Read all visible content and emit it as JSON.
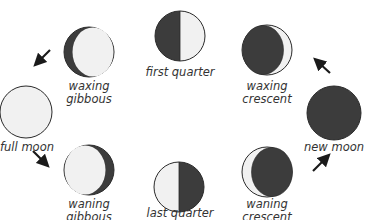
{
  "diagram": {
    "colors": {
      "dark": "#3c3c3c",
      "light": "#f1f1f1",
      "outline": "#2a2a2a",
      "text": "#333333"
    },
    "phases": [
      {
        "id": "first-quarter",
        "label_lines": [
          "first quarter"
        ]
      },
      {
        "id": "waxing-crescent",
        "label_lines": [
          "waxing",
          "crescent"
        ]
      },
      {
        "id": "new-moon",
        "label_lines": [
          "new moon"
        ]
      },
      {
        "id": "waning-crescent",
        "label_lines": [
          "waning",
          "crescent"
        ]
      },
      {
        "id": "last-quarter",
        "label_lines": [
          "last quarter"
        ]
      },
      {
        "id": "waning-gibbous",
        "label_lines": [
          "waning",
          "gibbous"
        ]
      },
      {
        "id": "full-moon",
        "label_lines": [
          "full moon"
        ]
      },
      {
        "id": "waxing-gibbous",
        "label_lines": [
          "waxing",
          "gibbous"
        ]
      }
    ],
    "arrows": [
      {
        "id": "arrow-waxing-gibbous-to-full",
        "direction": "down-left"
      },
      {
        "id": "arrow-new-to-waxing-crescent",
        "direction": "up-left"
      },
      {
        "id": "arrow-full-to-waning-gibbous",
        "direction": "down-right"
      },
      {
        "id": "arrow-waning-crescent-to-new",
        "direction": "up-right"
      }
    ]
  }
}
